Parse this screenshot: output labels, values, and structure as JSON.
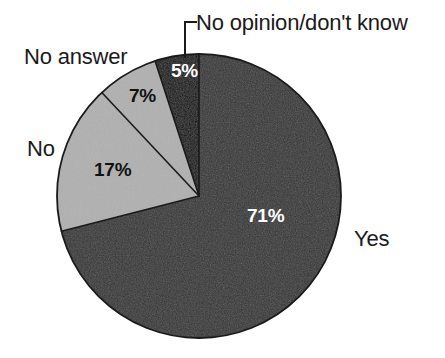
{
  "chart_data": {
    "type": "pie",
    "title": "",
    "subtitle": "",
    "xlabel": "",
    "ylabel": "",
    "legend_position": "none",
    "grid": false,
    "start_angle_deg": 0,
    "direction": "clockwise",
    "total": 100,
    "units": "%",
    "categories": [
      "Yes",
      "No",
      "No answer",
      "No opinion/don't know"
    ],
    "values": [
      71,
      17,
      7,
      5
    ],
    "value_labels": [
      "71%",
      "17%",
      "7%",
      "5%"
    ],
    "colors": [
      "#333333",
      "#b0b0b0",
      "#b0b0b0",
      "#050505"
    ],
    "slices": [
      {
        "label": "Yes",
        "value": 71,
        "value_label": "71%",
        "color": "#333333",
        "value_label_color": "#ffffff",
        "start_deg": 0,
        "end_deg": 255.6,
        "leader_line": false
      },
      {
        "label": "No",
        "value": 17,
        "value_label": "17%",
        "color": "#b0b0b0",
        "value_label_color": "#111111",
        "start_deg": 255.6,
        "end_deg": 316.8,
        "leader_line": false
      },
      {
        "label": "No answer",
        "value": 7,
        "value_label": "7%",
        "color": "#b0b0b0",
        "value_label_color": "#111111",
        "start_deg": 316.8,
        "end_deg": 342.0,
        "leader_line": false
      },
      {
        "label": "No opinion/don't know",
        "value": 5,
        "value_label": "5%",
        "color": "#050505",
        "value_label_color": "#ffffff",
        "start_deg": 342.0,
        "end_deg": 360.0,
        "leader_line": true
      }
    ]
  },
  "chart": {
    "labels": {
      "yes": "Yes",
      "no": "No",
      "no_answer": "No answer",
      "no_opinion": "No opinion/don't know"
    },
    "percents": {
      "yes": "71%",
      "no": "17%",
      "no_answer": "7%",
      "no_opinion": "5%"
    }
  },
  "theme": {
    "background": "#ffffff",
    "slice_dark": "#333333",
    "slice_gray": "#b0b0b0",
    "slice_black": "#050505",
    "outline": "#1a1a1a",
    "text": "#1a1a1a"
  }
}
